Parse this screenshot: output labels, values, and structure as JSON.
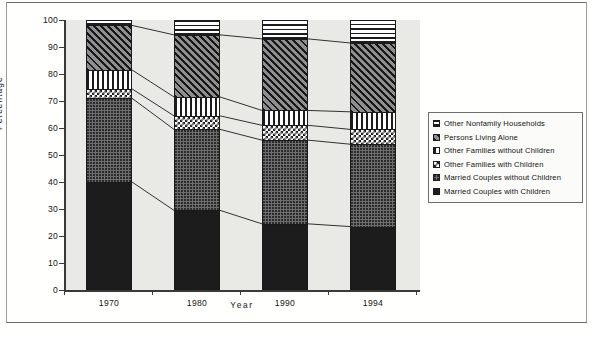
{
  "chart_data": {
    "type": "bar",
    "subtype": "stacked-bar-100",
    "title": "",
    "xlabel": "Year",
    "ylabel": "Percentage",
    "ylim": [
      0,
      100
    ],
    "ytick_labels": [
      "0",
      "10",
      "20",
      "30",
      "40",
      "50",
      "60",
      "70",
      "80",
      "90",
      "100"
    ],
    "ytick_values": [
      0,
      10,
      20,
      30,
      40,
      50,
      60,
      70,
      80,
      90,
      100
    ],
    "categories": [
      "1970",
      "1980",
      "1990",
      "1994"
    ],
    "grid": false,
    "legend_position": "right",
    "series": [
      {
        "name": "Married Couples with Children",
        "pattern": "solid-black",
        "values": [
          40.0,
          29.5,
          24.5,
          23.5
        ]
      },
      {
        "name": "Married Couples without Children",
        "pattern": "dots-dark",
        "values": [
          31.0,
          30.0,
          31.0,
          30.5
        ]
      },
      {
        "name": "Other Families with Children",
        "pattern": "checker",
        "values": [
          3.5,
          5.0,
          5.5,
          5.5
        ]
      },
      {
        "name": "Other Families without Children",
        "pattern": "vertical-stripe",
        "values": [
          7.0,
          7.0,
          5.5,
          6.5
        ]
      },
      {
        "name": "Persons Living Alone",
        "pattern": "diagonal-hatch",
        "values": [
          16.5,
          23.0,
          26.5,
          25.5
        ]
      },
      {
        "name": "Other Nonfamily Households",
        "pattern": "horizontal-stripe",
        "values": [
          2.0,
          5.5,
          7.0,
          8.5
        ]
      }
    ],
    "cumulative_tops": {
      "1970": [
        40.0,
        71.0,
        74.5,
        81.5,
        98.0,
        100.0
      ],
      "1980": [
        29.5,
        59.5,
        64.5,
        71.5,
        94.5,
        100.0
      ],
      "1990": [
        24.5,
        55.5,
        61.0,
        66.5,
        93.0,
        100.0
      ],
      "1994": [
        23.5,
        54.0,
        59.5,
        66.0,
        91.5,
        100.0
      ]
    }
  },
  "axes": {
    "ylabel": "Percentage",
    "xlabel": "Year",
    "yticks": [
      "100",
      "90",
      "80",
      "70",
      "60",
      "50",
      "40",
      "30",
      "20",
      "10",
      "0"
    ],
    "xticks": [
      "1970",
      "1980",
      "1990",
      "1994"
    ]
  },
  "legend": {
    "items": [
      {
        "label": "Other Nonfamily Households",
        "pattern": "horizontal-stripe"
      },
      {
        "label": "Persons Living Alone",
        "pattern": "diagonal-hatch"
      },
      {
        "label": "Other Families without Children",
        "pattern": "vertical-stripe"
      },
      {
        "label": "Other Families with Children",
        "pattern": "checker"
      },
      {
        "label": "Married Couples without Children",
        "pattern": "dots-dark"
      },
      {
        "label": "Married Couples with Children",
        "pattern": "solid-black"
      }
    ]
  },
  "colors": {
    "axis": "#3a3a3a",
    "plot_background": "#e9e9e6",
    "page_background": "#fdfdfb",
    "ink": "#1c1c1c",
    "rule": "#6b6b6b"
  }
}
